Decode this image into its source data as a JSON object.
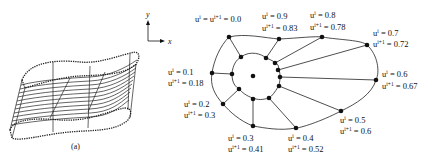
{
  "figure": {
    "panel_a_caption": "(a)",
    "axes": {
      "x_label": "x",
      "y_label": "y"
    }
  },
  "labels": [
    {
      "id": "n00",
      "line1": "u^i = u^{i+1} = 0.0",
      "ui": "0.0",
      "ui1": "0.0",
      "combined": true
    },
    {
      "id": "n09",
      "ui": "0.9",
      "ui1": "0.83"
    },
    {
      "id": "n08",
      "ui": "0.8",
      "ui1": "0.78"
    },
    {
      "id": "n07",
      "ui": "0.7",
      "ui1": "0.72"
    },
    {
      "id": "n06",
      "ui": "0.6",
      "ui1": "0.67"
    },
    {
      "id": "n05",
      "ui": "0.5",
      "ui1": "0.6"
    },
    {
      "id": "n04",
      "ui": "0.4",
      "ui1": "0.52"
    },
    {
      "id": "n03",
      "ui": "0.3",
      "ui1": "0.41"
    },
    {
      "id": "n02",
      "ui": "0.2",
      "ui1": "0.3"
    },
    {
      "id": "n01",
      "ui": "0.1",
      "ui1": "0.18"
    }
  ],
  "text": {
    "u": "u",
    "sup_i": "i",
    "sup_i1": "i+1",
    "eq": " = "
  }
}
